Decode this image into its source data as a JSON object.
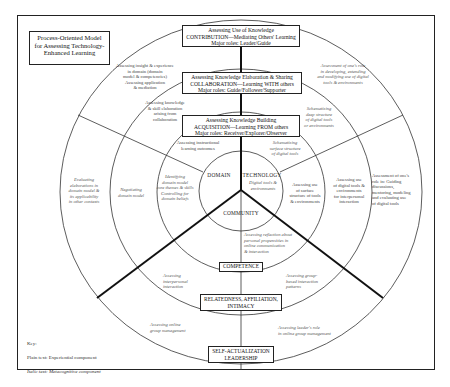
{
  "title": "Process-Oriented Model\nfor Assessing Technology-\nEnhanced Learning",
  "core": {
    "domain": "DOMAIN",
    "technology": "TECHNOLOGY",
    "technology_sub": "Digital tools &\nenvironments",
    "community": "COMMUNITY"
  },
  "levels": {
    "contribution": "Assessing Use of Knowledge\nCONTRIBUTION—Mediating Others' Learning\nMajor roles: Leader/Guide",
    "collaboration": "Assessing Knowledge Elaboration & Sharing\nCOLLABORATION—Learning WITH others\nMajor roles: Guide/Follower/Supporter",
    "acquisition": "Assessing Knowledge Building\nACQUISITION—Learning FROM others\nMajor roles: Receiver/Explorer/Observer",
    "competence": "COMPETENCE",
    "relatedness": "RELATEDNESS, AFFILIATION,\nINTIMACY",
    "self_actualization": "SELF-ACTUALIZATION\nLEADERSHIP"
  },
  "domain_texts": {
    "outer": "Assessing insight & experience\nin domain (domain\nmodel & competencies)\nAssessing application\n& mediation",
    "middle": "Assessing knowledge\n& skill elaboration\narising from\ncollaboration",
    "inner": "Assessing instructional\nlearning outcomes",
    "inner_meta": "Identifying\ndomain model\ncore themes & skills\nControlling for\ndomain beliefs",
    "middle_meta": "Negotiating\ndomain model",
    "outer_meta": "Evaluating\nelaborations in\ndomain model &\nits applicability\nin other contexts"
  },
  "technology_texts": {
    "outer_meta": "Assessment of one's role\nin developing, extending\nand modifying use of digital\ntools & environments",
    "middle_meta": "Schematizing\ndeep structure\nof digital tools\nor environments",
    "inner_meta": "Schematizing\nsurface structure\nof digital tools",
    "inner": "Assessing use\nof surface\nstructure of tools\n& environments",
    "middle": "Assessing use\nof digital tools &\nenvironments\nfor interpersonal\ninteraction",
    "outer": "Assessment of one's\nrole in: Guiding\ndiscussions,\nmentoring, modeling\nand evaluating use\nof digital tools"
  },
  "community_texts": {
    "inner_meta": "Assessing reflection about\npersonal propensities in\nonline communication\n& interaction",
    "middle": "Assessing\ninterpersonal\ninteraction",
    "middle_meta": "Assessing group-\nbased interaction\npatterns",
    "outer": "Assessing online\ngroup management",
    "outer_meta": "Assessing leader's role\nin online group management"
  },
  "key": {
    "heading": "Key:",
    "plain": "Plain text: Experiential component",
    "italic": "Italic text: Metacognitive component"
  },
  "colors": {
    "line": "#222222",
    "text": "#333333",
    "background": "#ffffff"
  }
}
